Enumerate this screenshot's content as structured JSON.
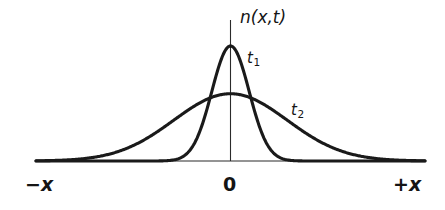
{
  "figure": {
    "kind": "line-plot",
    "background_color": "#ffffff",
    "line_color": "#1a1a1a",
    "axis_color": "#2b2b2b"
  },
  "labels": {
    "y_axis": "n(x,t)",
    "curve_t1_base": "t",
    "curve_t1_sub": "1",
    "curve_t2_base": "t",
    "curve_t2_sub": "2",
    "x_left": "−x",
    "x_origin": "0",
    "x_right": "+x"
  },
  "chart_data": {
    "type": "line",
    "title": "",
    "xlabel": "",
    "ylabel": "n(x,t)",
    "xlim": [
      -4.8,
      4.8
    ],
    "ylim": [
      0,
      1.0
    ],
    "grid": false,
    "legend": "inline-annotation",
    "x_tick_labels": [
      "−x",
      "0",
      "+x"
    ],
    "x_tick_values": [
      -4.8,
      0,
      4.8
    ],
    "annotations": [
      {
        "text": "t1",
        "x": 0.52,
        "y": 0.86,
        "note": "label for narrow early-time curve"
      },
      {
        "text": "t2",
        "x": 1.63,
        "y": 0.46,
        "note": "label for broad later-time curve"
      }
    ],
    "series": [
      {
        "name": "t1",
        "description": "narrow tall gaussian, early time",
        "peak_x": 0.0,
        "peak_y": 1.0,
        "sigma": 0.46,
        "x": [
          -4.8,
          -4.0,
          -3.2,
          -2.4,
          -1.8,
          -1.4,
          -1.2,
          -1.0,
          -0.8,
          -0.6,
          -0.4,
          -0.2,
          0.0,
          0.2,
          0.4,
          0.6,
          0.8,
          1.0,
          1.2,
          1.4,
          1.8,
          2.4,
          3.2,
          4.0,
          4.8
        ],
        "y": [
          0.0,
          0.0,
          0.0,
          0.0,
          0.001,
          0.024,
          0.053,
          0.11,
          0.2,
          0.33,
          0.47,
          0.63,
          1.0,
          0.63,
          0.47,
          0.33,
          0.2,
          0.11,
          0.053,
          0.024,
          0.001,
          0.0,
          0.0,
          0.0,
          0.0
        ]
      },
      {
        "name": "t2",
        "description": "broad low gaussian, later time",
        "peak_x": 0.0,
        "peak_y": 0.585,
        "sigma": 1.4,
        "x": [
          -4.8,
          -4.2,
          -3.6,
          -3.0,
          -2.4,
          -2.0,
          -1.6,
          -1.2,
          -0.8,
          -0.4,
          0.0,
          0.4,
          0.8,
          1.2,
          1.6,
          2.0,
          2.4,
          3.0,
          3.6,
          4.2,
          4.8
        ],
        "y": [
          0.0,
          0.005,
          0.02,
          0.05,
          0.1,
          0.16,
          0.24,
          0.34,
          0.45,
          0.54,
          0.585,
          0.54,
          0.45,
          0.34,
          0.24,
          0.16,
          0.1,
          0.05,
          0.02,
          0.005,
          0.0
        ]
      }
    ]
  }
}
